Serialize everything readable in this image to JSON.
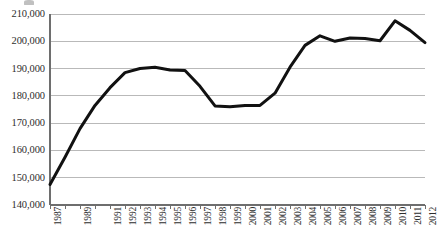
{
  "chart_data": {
    "type": "line",
    "title": "",
    "subtitle": "",
    "xlabel": "",
    "ylabel": "",
    "grid": "horizontal",
    "legend": "none",
    "ylim": [
      140000,
      210000
    ],
    "ytick_step": 10000,
    "ytick_labels": [
      "210,000",
      "200,000",
      "190,000",
      "180,000",
      "170,000",
      "160,000",
      "150,000",
      "140,000"
    ],
    "ytick_values": [
      210000,
      200000,
      190000,
      180000,
      170000,
      160000,
      150000,
      140000
    ],
    "xtick_labels": [
      "1987",
      "1989",
      "1991",
      "1992",
      "1993",
      "1994",
      "1995",
      "1996",
      "1997",
      "1998",
      "1999",
      "2000",
      "2001",
      "2002",
      "2003",
      "2004",
      "2005",
      "2006",
      "2007",
      "2008",
      "2009",
      "2010",
      "2011",
      "2012"
    ],
    "x": [
      1987,
      1988,
      1989,
      1990,
      1991,
      1992,
      1993,
      1994,
      1995,
      1996,
      1997,
      1998,
      1999,
      2000,
      2001,
      2002,
      2003,
      2004,
      2005,
      2006,
      2007,
      2008,
      2009,
      2010,
      2011,
      2012
    ],
    "categories": [
      "1987",
      "1988",
      "1989",
      "1990",
      "1991",
      "1992",
      "1993",
      "1994",
      "1995",
      "1996",
      "1997",
      "1998",
      "1999",
      "2000",
      "2001",
      "2002",
      "2003",
      "2004",
      "2005",
      "2006",
      "2007",
      "2008",
      "2009",
      "2010",
      "2011",
      "2012"
    ],
    "values": [
      147500,
      157500,
      168000,
      176500,
      183000,
      188500,
      190000,
      190500,
      189500,
      189300,
      183500,
      176300,
      176000,
      176500,
      176500,
      181000,
      190500,
      198500,
      202000,
      200000,
      201200,
      201000,
      200200,
      207500,
      204000,
      199500
    ],
    "series": [
      {
        "name": "series-1",
        "color": "#111111",
        "line_width": 3,
        "markers": "none",
        "values": [
          147500,
          157500,
          168000,
          176500,
          183000,
          188500,
          190000,
          190500,
          189500,
          189300,
          183500,
          176300,
          176000,
          176500,
          176500,
          181000,
          190500,
          198500,
          202000,
          200000,
          201200,
          201000,
          200200,
          207500,
          204000,
          199500
        ]
      }
    ],
    "annotations": []
  },
  "style": {
    "grid_color": "#b9b9b9",
    "axis_color": "#6e6e6e",
    "line_color": "#111111",
    "background": "#ffffff",
    "text_color": "#2e2e2e"
  }
}
